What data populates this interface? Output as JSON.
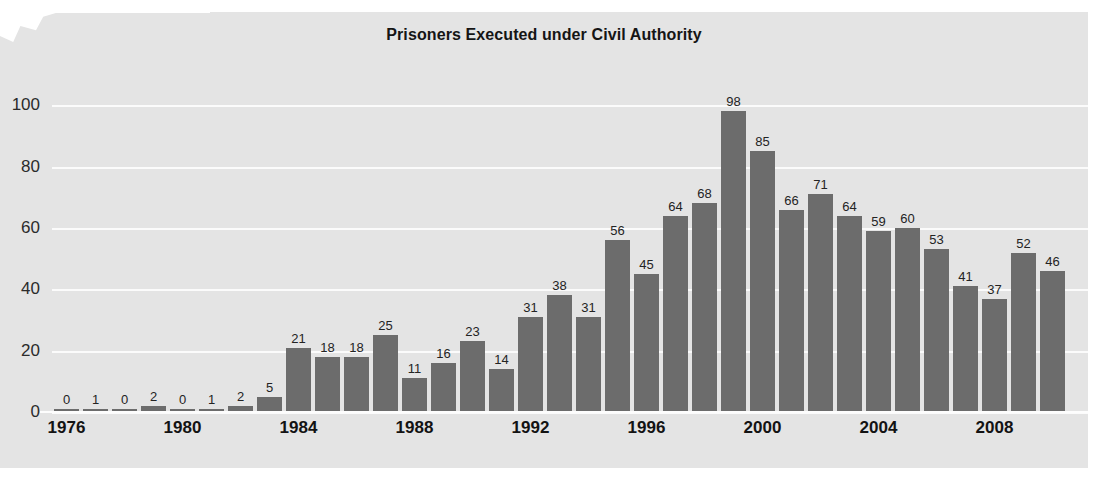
{
  "chart_data": {
    "type": "bar",
    "title": "Prisoners Executed under Civil Authority",
    "xlabel": "",
    "ylabel": "",
    "ylim": [
      0,
      105
    ],
    "yticks": [
      0,
      20,
      40,
      60,
      80,
      100
    ],
    "grid": true,
    "legend": false,
    "bar_labels_shown": true,
    "bar_color": "#6c6c6c",
    "background_color": "#e4e4e4",
    "gridline_color": "#fbfbfb",
    "categories": [
      "1976",
      "1977",
      "1978",
      "1979",
      "1980",
      "1981",
      "1982",
      "1983",
      "1984",
      "1985",
      "1986",
      "1987",
      "1988",
      "1989",
      "1990",
      "1991",
      "1992",
      "1993",
      "1994",
      "1995",
      "1996",
      "1997",
      "1998",
      "1999",
      "2000",
      "2001",
      "2002",
      "2003",
      "2004",
      "2005",
      "2006",
      "2007",
      "2008",
      "2009",
      "2010"
    ],
    "values": [
      0,
      1,
      0,
      2,
      0,
      1,
      2,
      5,
      21,
      18,
      18,
      25,
      11,
      16,
      23,
      14,
      31,
      38,
      31,
      56,
      45,
      64,
      68,
      98,
      85,
      66,
      71,
      64,
      59,
      60,
      53,
      41,
      37,
      52,
      46
    ],
    "xtick_labels": [
      "1976",
      "1980",
      "1984",
      "1988",
      "1992",
      "1996",
      "2000",
      "2004",
      "2008"
    ],
    "xtick_categories": [
      "1976",
      "1980",
      "1984",
      "1988",
      "1992",
      "1996",
      "2000",
      "2004",
      "2008"
    ]
  }
}
